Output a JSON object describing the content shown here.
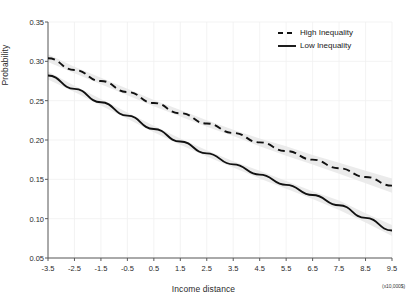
{
  "chart_data": {
    "type": "line",
    "title": "",
    "xlabel": "Income distance",
    "ylabel": "Probability",
    "x_unit_note": "(x10,000$)",
    "xlim": [
      -3.5,
      9.5
    ],
    "ylim": [
      0.05,
      0.35
    ],
    "grid": true,
    "grid_color": "#f0f0f0",
    "legend_position": "top-right",
    "xticks": [
      "-3.5",
      "-2.5",
      "-1.5",
      "-0.5",
      "0.5",
      "1.5",
      "2.5",
      "3.5",
      "4.5",
      "5.5",
      "6.5",
      "7.5",
      "8.5",
      "9.5"
    ],
    "xtick_values": [
      -3.5,
      -2.5,
      -1.5,
      -0.5,
      0.5,
      1.5,
      2.5,
      3.5,
      4.5,
      5.5,
      6.5,
      7.5,
      8.5,
      9.5
    ],
    "yticks": [
      "0.05",
      "0.10",
      "0.15",
      "0.20",
      "0.25",
      "0.30",
      "0.35"
    ],
    "ytick_values": [
      0.05,
      0.1,
      0.15,
      0.2,
      0.25,
      0.3,
      0.35
    ],
    "x": [
      -3.5,
      -2.5,
      -1.5,
      -0.5,
      0.5,
      1.5,
      2.5,
      3.5,
      4.5,
      5.5,
      6.5,
      7.5,
      8.5,
      9.5
    ],
    "series": [
      {
        "name": "High Inequality",
        "style": "dashed",
        "color": "#111111",
        "values": [
          0.304,
          0.289,
          0.275,
          0.261,
          0.247,
          0.234,
          0.221,
          0.209,
          0.197,
          0.186,
          0.175,
          0.164,
          0.153,
          0.142
        ],
        "band_lower": [
          0.299,
          0.285,
          0.271,
          0.257,
          0.243,
          0.23,
          0.217,
          0.205,
          0.192,
          0.18,
          0.169,
          0.157,
          0.145,
          0.133
        ],
        "band_upper": [
          0.309,
          0.293,
          0.279,
          0.265,
          0.251,
          0.238,
          0.225,
          0.213,
          0.202,
          0.192,
          0.181,
          0.171,
          0.161,
          0.151
        ]
      },
      {
        "name": "Low Inequality",
        "style": "solid",
        "color": "#111111",
        "values": [
          0.282,
          0.265,
          0.248,
          0.231,
          0.214,
          0.198,
          0.183,
          0.169,
          0.156,
          0.143,
          0.13,
          0.117,
          0.101,
          0.085
        ],
        "band_lower": [
          0.277,
          0.261,
          0.244,
          0.227,
          0.21,
          0.194,
          0.179,
          0.165,
          0.151,
          0.138,
          0.125,
          0.111,
          0.095,
          0.078
        ],
        "band_upper": [
          0.287,
          0.269,
          0.252,
          0.235,
          0.218,
          0.202,
          0.187,
          0.173,
          0.161,
          0.148,
          0.135,
          0.123,
          0.107,
          0.092
        ]
      }
    ],
    "band_color": "#e8e8e8"
  },
  "legend": {
    "items": [
      {
        "label": "High Inequality",
        "style": "dashed"
      },
      {
        "label": "Low Inequality",
        "style": "solid"
      }
    ]
  }
}
